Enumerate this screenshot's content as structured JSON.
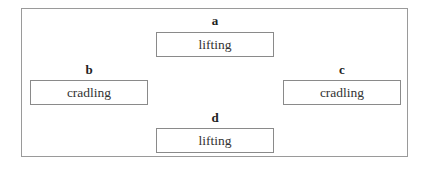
{
  "diagram": {
    "nodes": [
      {
        "id": "a",
        "label": "a",
        "text": "lifting"
      },
      {
        "id": "b",
        "label": "b",
        "text": "cradling"
      },
      {
        "id": "c",
        "label": "c",
        "text": "cradling"
      },
      {
        "id": "d",
        "label": "d",
        "text": "lifting"
      }
    ]
  }
}
